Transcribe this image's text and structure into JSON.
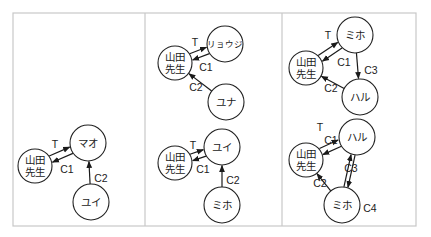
{
  "figure": {
    "frame": {
      "x": 13,
      "y": 13,
      "w": 403,
      "h": 213
    },
    "dividers": [
      145,
      282
    ],
    "colors": {
      "stroke": "#222222",
      "frame": "#c8c8c8",
      "background": "#ffffff"
    }
  },
  "diagrams": [
    {
      "id": "panel1-graph",
      "nodes": [
        {
          "id": "yamada",
          "lines": [
            "山田",
            "先生"
          ],
          "cx": 35,
          "cy": 166,
          "r": 17
        },
        {
          "id": "mao",
          "lines": [
            "マオ"
          ],
          "cx": 88,
          "cy": 143,
          "r": 18
        },
        {
          "id": "yui",
          "lines": [
            "ユイ"
          ],
          "cx": 91,
          "cy": 202,
          "r": 18
        }
      ],
      "edges": [
        {
          "from": "yamada",
          "to": "mao",
          "label": "T",
          "offset": -3.5,
          "lx": 55,
          "ly": 144
        },
        {
          "from": "mao",
          "to": "yamada",
          "label": "C1",
          "offset": -3.5,
          "lx": 67,
          "ly": 169
        },
        {
          "from": "yui",
          "to": "mao",
          "label": "C2",
          "offset": 0,
          "lx": 101,
          "ly": 178
        }
      ]
    },
    {
      "id": "panel2-top-graph",
      "nodes": [
        {
          "id": "yamada",
          "lines": [
            "山田",
            "先生"
          ],
          "cx": 175,
          "cy": 63,
          "r": 17
        },
        {
          "id": "ryoji",
          "lines": [
            "リョウジ"
          ],
          "cx": 225,
          "cy": 44,
          "r": 18,
          "small": true
        },
        {
          "id": "yuna",
          "lines": [
            "ユナ"
          ],
          "cx": 226,
          "cy": 102,
          "r": 18
        }
      ],
      "edges": [
        {
          "from": "yamada",
          "to": "ryoji",
          "label": "T",
          "offset": -3.5,
          "lx": 195,
          "ly": 42
        },
        {
          "from": "ryoji",
          "to": "yamada",
          "label": "C1",
          "offset": -3.5,
          "lx": 206,
          "ly": 67
        },
        {
          "from": "yuna",
          "to": "yamada",
          "label": "C2",
          "offset": 0,
          "lx": 196,
          "ly": 87
        }
      ]
    },
    {
      "id": "panel2-bottom-graph",
      "nodes": [
        {
          "id": "yamada",
          "lines": [
            "山田",
            "先生"
          ],
          "cx": 175,
          "cy": 163,
          "r": 17
        },
        {
          "id": "yui",
          "lines": [
            "ユイ"
          ],
          "cx": 222,
          "cy": 147,
          "r": 18
        },
        {
          "id": "miho",
          "lines": [
            "ミホ"
          ],
          "cx": 222,
          "cy": 205,
          "r": 18
        }
      ],
      "edges": [
        {
          "from": "yamada",
          "to": "yui",
          "label": "T",
          "offset": -3.5,
          "lx": 193,
          "ly": 145
        },
        {
          "from": "yui",
          "to": "yamada",
          "label": "C1",
          "offset": -3.5,
          "lx": 203,
          "ly": 169
        },
        {
          "from": "miho",
          "to": "yui",
          "label": "C2",
          "offset": 0,
          "lx": 233,
          "ly": 180
        }
      ]
    },
    {
      "id": "panel3-top-graph",
      "nodes": [
        {
          "id": "yamada",
          "lines": [
            "山田",
            "先生"
          ],
          "cx": 306,
          "cy": 68,
          "r": 17
        },
        {
          "id": "miho",
          "lines": [
            "ミホ"
          ],
          "cx": 355,
          "cy": 35,
          "r": 18
        },
        {
          "id": "haru",
          "lines": [
            "ハル"
          ],
          "cx": 360,
          "cy": 97,
          "r": 18
        }
      ],
      "edges": [
        {
          "from": "yamada",
          "to": "miho",
          "label": "T",
          "offset": -3.5,
          "lx": 328,
          "ly": 35
        },
        {
          "from": "miho",
          "to": "yamada",
          "label": "C1",
          "offset": -3.5,
          "lx": 344,
          "ly": 62
        },
        {
          "from": "miho",
          "to": "haru",
          "label": "C3",
          "offset": 0,
          "lx": 371,
          "ly": 70
        },
        {
          "from": "haru",
          "to": "yamada",
          "label": "C2",
          "offset": 0,
          "lx": 331,
          "ly": 88
        }
      ]
    },
    {
      "id": "panel3-bottom-graph",
      "nodes": [
        {
          "id": "yamada",
          "lines": [
            "山田",
            "先生"
          ],
          "cx": 306,
          "cy": 160,
          "r": 17
        },
        {
          "id": "haru",
          "lines": [
            "ハル"
          ],
          "cx": 357,
          "cy": 137,
          "r": 18
        },
        {
          "id": "miho",
          "lines": [
            "ミホ"
          ],
          "cx": 342,
          "cy": 205,
          "r": 18
        }
      ],
      "edges": [
        {
          "from": "yamada",
          "to": "haru",
          "label": "T",
          "offset": -5,
          "lx": 320,
          "ly": 127
        },
        {
          "from": "haru",
          "to": "yamada",
          "label": "C1",
          "offset": -2,
          "lx": 331,
          "ly": 140
        },
        {
          "from": "haru",
          "to": "miho",
          "label": "C3",
          "offset": -2,
          "lx": 351,
          "ly": 168
        },
        {
          "from": "miho",
          "to": "haru",
          "label": "C4",
          "offset": -2,
          "lx": 370,
          "ly": 208
        },
        {
          "from": "miho",
          "to": "yamada",
          "label": "C2",
          "offset": 0,
          "lx": 320,
          "ly": 183
        }
      ]
    }
  ]
}
